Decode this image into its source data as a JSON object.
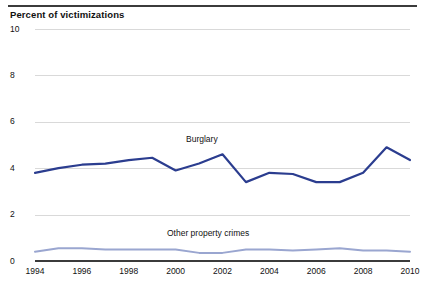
{
  "header": {
    "axis_title": "Percent of victimizations"
  },
  "chart_data": {
    "type": "line",
    "title": "",
    "subtitle": "",
    "xlabel": "",
    "ylabel": "Percent of victimizations",
    "ylim": [
      0,
      10
    ],
    "xlim": [
      1994,
      2010
    ],
    "ytick_labels": [
      "0",
      "2",
      "4",
      "6",
      "8",
      "10"
    ],
    "ytick_values": [
      0,
      2,
      4,
      6,
      8,
      10
    ],
    "xtick_labels": [
      "1994",
      "1996",
      "1998",
      "2000",
      "2002",
      "2004",
      "2006",
      "2008",
      "2010"
    ],
    "xtick_values": [
      1994,
      1996,
      1998,
      2000,
      2002,
      2004,
      2006,
      2008,
      2010
    ],
    "x": [
      1994,
      1995,
      1996,
      1997,
      1998,
      1999,
      2000,
      2001,
      2002,
      2003,
      2004,
      2005,
      2006,
      2007,
      2008,
      2009,
      2010
    ],
    "grid": true,
    "grid_axis": "y",
    "legend_position": "inline-annotation",
    "series": [
      {
        "name": "Burglary",
        "color": "#2b3d8f",
        "values": [
          3.8,
          4.0,
          4.15,
          4.2,
          4.35,
          4.45,
          3.9,
          4.2,
          4.6,
          3.4,
          3.8,
          3.75,
          3.4,
          3.4,
          3.8,
          4.9,
          4.35
        ]
      },
      {
        "name": "Other property crimes",
        "color": "#9aa6d0",
        "values": [
          0.4,
          0.55,
          0.55,
          0.5,
          0.5,
          0.5,
          0.5,
          0.35,
          0.35,
          0.5,
          0.5,
          0.45,
          0.5,
          0.55,
          0.45,
          0.45,
          0.4
        ]
      }
    ],
    "annotations": [
      {
        "text": "Burglary",
        "x": 2001,
        "y": 5.4
      },
      {
        "text": "Other property crimes",
        "x": 2000.4,
        "y": 1.4
      }
    ]
  }
}
